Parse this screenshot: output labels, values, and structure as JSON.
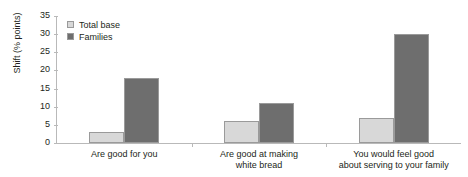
{
  "chart_data": {
    "type": "bar",
    "title": "",
    "xlabel": "",
    "ylabel": "Shift (% points)",
    "ylim": [
      0,
      35
    ],
    "ytick_step": 5,
    "yticks": [
      35,
      30,
      25,
      20,
      15,
      10,
      5,
      0
    ],
    "grid": false,
    "legend_position": "top-left",
    "categories": [
      "Are good for you",
      "Are good at making white bread",
      "You would feel good about serving to your family"
    ],
    "category_lines": [
      [
        "Are good for you"
      ],
      [
        "Are good at making",
        "white bread"
      ],
      [
        "You would feel good",
        "about serving to your family"
      ]
    ],
    "series": [
      {
        "name": "Total base",
        "color": "#d8d8d8",
        "values": [
          3,
          6,
          7
        ]
      },
      {
        "name": "Families",
        "color": "#6e6e6e",
        "values": [
          18,
          11,
          30
        ]
      }
    ]
  },
  "colors": {
    "total_base": "#d8d8d8",
    "families": "#6e6e6e",
    "bar_outline": "#9a9a9a",
    "axis": "#b9b9b9",
    "text": "#231f20",
    "background": "#ffffff"
  }
}
